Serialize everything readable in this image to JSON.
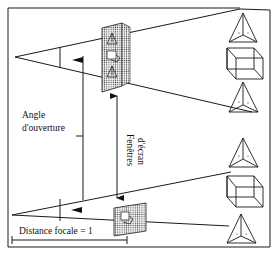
{
  "figure": {
    "type": "perspective viewing frustum diagram",
    "labels": {
      "opening_angle_line1": "Angle",
      "opening_angle_line2": "d'ouverture",
      "screen_windows_line1": "Fenêtres",
      "screen_windows_line2": "d'écran",
      "focal_distance": "Distance focale = 1"
    },
    "frustums": [
      {
        "name": "upper",
        "screen_window": "hatched",
        "objects": [
          "tetrahedron",
          "cube",
          "tetrahedron"
        ]
      },
      {
        "name": "lower",
        "screen_window": "hatched",
        "objects": [
          "tetrahedron",
          "cube",
          "tetrahedron"
        ]
      }
    ],
    "colors": {
      "line": "#1a1a1a",
      "background": "#ffffff",
      "hatch": "#555555"
    }
  }
}
